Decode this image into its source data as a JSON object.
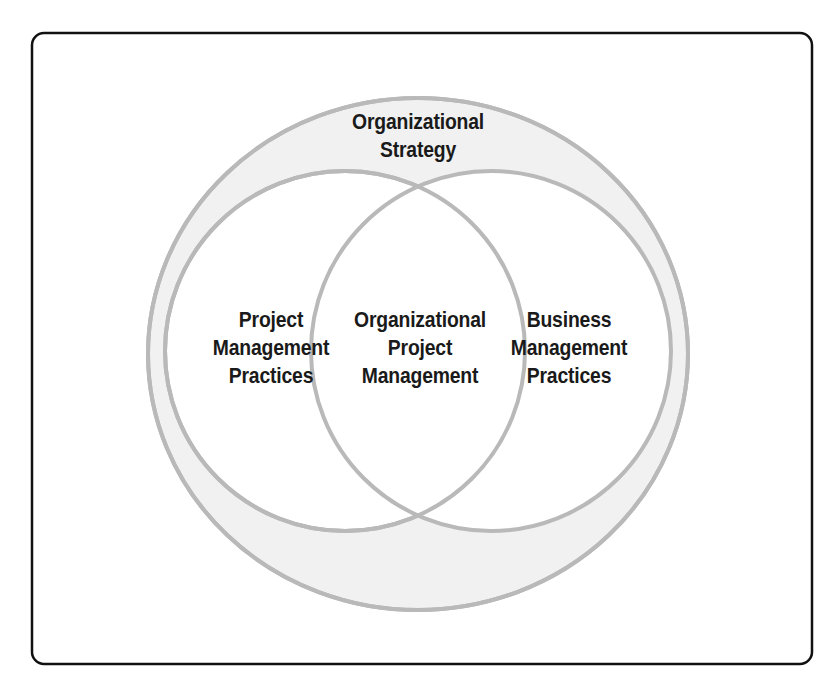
{
  "figure": {
    "type": "venn-diagram",
    "background_color": "#ffffff",
    "frame": {
      "border_color": "#111111",
      "border_width_px": 2.5,
      "corner_radius_px": 12,
      "x": 32,
      "y": 33,
      "width": 780,
      "height": 631
    },
    "palette": {
      "shape_stroke": "#b9b9b9",
      "outer_fill": "#f1f1f1",
      "circle_fill": "#ffffff",
      "text_color": "#1a1a1a"
    },
    "shapes": {
      "outer_ellipse": {
        "name": "organizational-strategy-ellipse",
        "cx": 418,
        "cy": 354,
        "rx": 270,
        "ry": 256,
        "fill": "#f1f1f1",
        "stroke": "#b9b9b9",
        "stroke_width": 4
      },
      "left_circle": {
        "name": "project-management-practices-circle",
        "cx": 345,
        "cy": 351,
        "r": 180,
        "fill": "#ffffff",
        "stroke": "#b9b9b9",
        "stroke_width": 4
      },
      "right_circle": {
        "name": "business-management-practices-circle",
        "cx": 491,
        "cy": 351,
        "r": 180,
        "fill": "#ffffff",
        "stroke": "#b9b9b9",
        "stroke_width": 4
      },
      "intersection_points": [
        {
          "x": 418,
          "y": 192
        },
        {
          "x": 418,
          "y": 512
        }
      ]
    },
    "labels": {
      "outer": "Organizational\nStrategy",
      "left": "Project\nManagement\nPractices",
      "center": "Organizational\nProject\nManagement",
      "right": "Business\nManagement\nPractices"
    }
  }
}
